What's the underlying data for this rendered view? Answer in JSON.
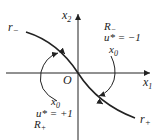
{
  "diagram": {
    "axes": {
      "x_label": "x",
      "x_sub": "1",
      "y_label": "x",
      "y_sub": "2",
      "origin_label": "O"
    },
    "curves": {
      "r_minus": {
        "label": "r",
        "sub": "−"
      },
      "r_plus": {
        "label": "r",
        "sub": "+"
      }
    },
    "regions": {
      "upper_right": {
        "region": "R",
        "region_sub": "−",
        "control": "u* = −1",
        "start": "x",
        "start_sub": "0"
      },
      "lower_left": {
        "region": "R",
        "region_sub": "+",
        "control": "u* = +1",
        "start": "x",
        "start_sub": "0"
      }
    }
  }
}
